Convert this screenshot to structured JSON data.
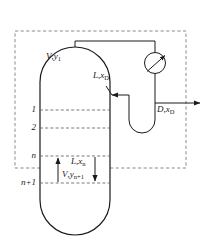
{
  "figure": {
    "type": "process-flow-diagram",
    "width": 206,
    "height": 244,
    "background_color": "#ffffff",
    "line_color": "#1a1a1a",
    "dashed_color": "#7a7a7a"
  },
  "labels": {
    "vapor_overhead": {
      "symbol": "V",
      "comma": ",",
      "stream": "y",
      "subscript": "1",
      "text": "V,y1"
    },
    "reflux": {
      "symbol": "L",
      "comma": ",",
      "stream": "x",
      "subscript": "D",
      "text": "L,xD"
    },
    "distillate": {
      "symbol": "D",
      "comma": ",",
      "stream": "x",
      "subscript": "D",
      "text": "D,xD"
    },
    "liquid_down": {
      "symbol": "L",
      "comma": ",",
      "stream": "x",
      "subscript": "n",
      "text": "L,xn"
    },
    "vapor_up": {
      "symbol": "V",
      "comma": ",",
      "stream": "y",
      "subscript": "n+1",
      "text": "V,yn+1"
    }
  },
  "stages": [
    {
      "id": "stage-1",
      "label": "1",
      "y": 110
    },
    {
      "id": "stage-2",
      "label": "2",
      "y": 128
    },
    {
      "id": "stage-n",
      "label": "n",
      "y": 156
    },
    {
      "id": "stage-n-plus-1",
      "label": "n+1",
      "y": 183
    }
  ],
  "equipment": {
    "column_name": "distillation-column",
    "condenser_name": "condenser",
    "reflux_drum_name": "reflux-drum",
    "envelope_name": "control-volume-boundary"
  }
}
